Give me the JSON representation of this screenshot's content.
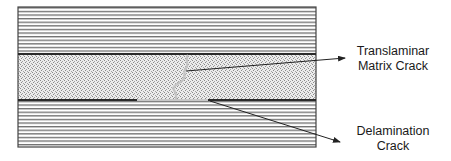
{
  "diagram": {
    "layers": [
      {
        "name": "top-ply",
        "pattern": "horizontal-fibers",
        "y_top": 7,
        "y_bottom": 54
      },
      {
        "name": "middle-ply",
        "pattern": "stippled-transverse",
        "y_top": 54,
        "y_bottom": 100
      },
      {
        "name": "bottom-ply",
        "pattern": "horizontal-fibers",
        "y_top": 100,
        "y_bottom": 147
      }
    ],
    "labels": {
      "translaminar": {
        "line1": "Translaminar",
        "line2": "Matrix Crack"
      },
      "delamination": {
        "line1": "Delamination",
        "line2": "Crack"
      }
    },
    "colors": {
      "fiber_line": "#6e6e6e",
      "ply_border": "#2a2a2a",
      "crack": "#c4c4c4",
      "arrow": "#222222",
      "stipple_bg": "#e6e6e6"
    }
  }
}
